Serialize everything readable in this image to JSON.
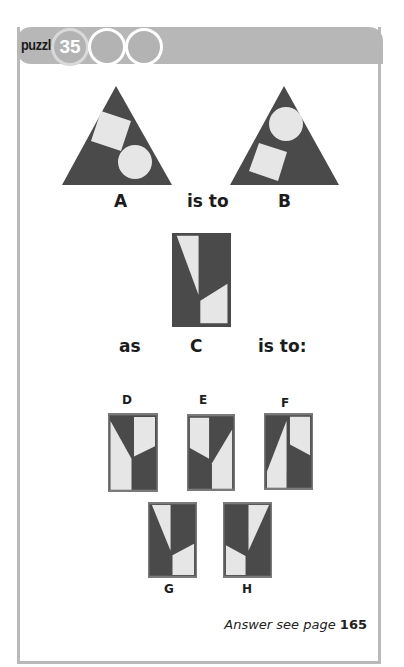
{
  "header": {
    "puzzle_label": "puzzle",
    "puzzle_number": "35",
    "empty_circles": 2
  },
  "colors": {
    "dark": "#4a4a4a",
    "light": "#e6e6e6",
    "header_bg": "#b7b7b7",
    "border": "#b9b9b9"
  },
  "analogy": {
    "figure_a_label": "A",
    "connector_1": "is to",
    "figure_b_label": "B",
    "prefix": "as",
    "figure_c_label": "C",
    "connector_2": "is to:"
  },
  "options": [
    {
      "label": "D"
    },
    {
      "label": "E"
    },
    {
      "label": "F"
    },
    {
      "label": "G"
    },
    {
      "label": "H"
    }
  ],
  "footer": {
    "answer_text": "Answer see page",
    "answer_page": "165"
  }
}
